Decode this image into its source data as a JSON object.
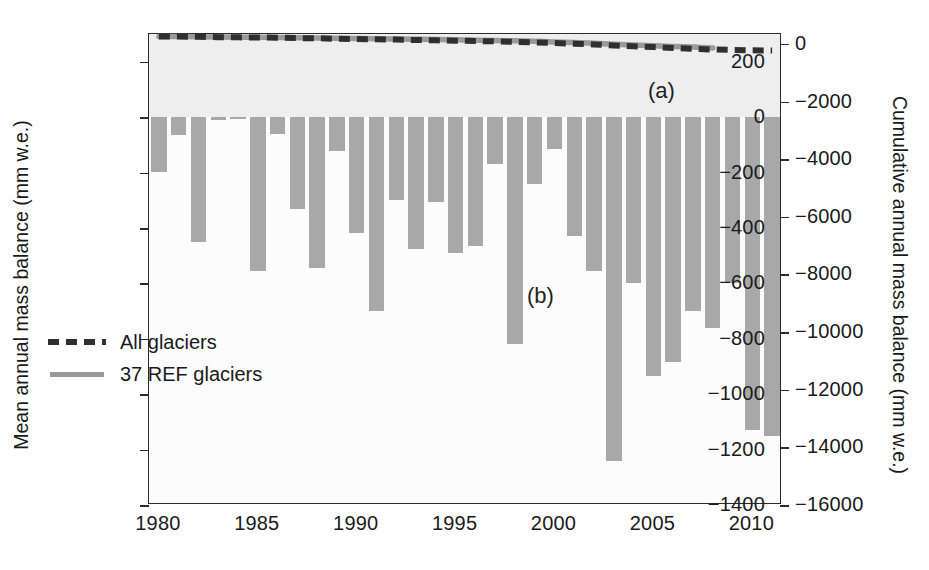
{
  "figure": {
    "panel_labels": [
      {
        "text": "(a)",
        "x_px": 648,
        "y_px": 78
      },
      {
        "text": "(b)",
        "x_px": 527,
        "y_px": 283
      }
    ]
  },
  "legend": {
    "position": "inside-lower-left",
    "entries": [
      {
        "label": "All glaciers",
        "style": "dashed",
        "color": "#2f2f2f"
      },
      {
        "label": "37 REF glaciers",
        "style": "solid",
        "color": "#9a9a9a"
      }
    ]
  },
  "chart_data": {
    "type": "bar",
    "title": "",
    "subtitle": "",
    "xlabel": "",
    "ylabel": "Mean annual mass balance (mm w.e.)",
    "y2label": "Cumulative annual mass balance (mm w.e.)",
    "grid": false,
    "xlim": [
      1979.5,
      2011.5
    ],
    "ylim": [
      -1400,
      300
    ],
    "y2lim": [
      -16000,
      343
    ],
    "xticks": [
      1980,
      1985,
      1990,
      1995,
      2000,
      2005,
      2010
    ],
    "xticklabels": [
      "1980",
      "1985",
      "1990",
      "1995",
      "2000",
      "2005",
      "2010"
    ],
    "yticks": [
      200,
      0,
      -200,
      -400,
      -600,
      -800,
      -1000,
      -1200,
      -1400
    ],
    "yticklabels": [
      "200",
      "0",
      "-200",
      "-400",
      "-600",
      "-800",
      "-1000",
      "-1200",
      "-1400"
    ],
    "y2ticks": [
      0,
      -2000,
      -4000,
      -6000,
      -8000,
      -10000,
      -12000,
      -14000,
      -16000
    ],
    "y2ticklabels": [
      "0",
      "-2000",
      "-4000",
      "-6000",
      "-8000",
      "-10000",
      "-12000",
      "-14000",
      "-16000"
    ],
    "bar_color": "#a8a8a8",
    "categories": [
      1980,
      1981,
      1982,
      1983,
      1984,
      1985,
      1986,
      1987,
      1988,
      1989,
      1990,
      1991,
      1992,
      1993,
      1994,
      1995,
      1996,
      1997,
      1998,
      1999,
      2000,
      2001,
      2002,
      2003,
      2004,
      2005,
      2006,
      2007,
      2008,
      2009,
      2010,
      2011
    ],
    "series": [
      {
        "name": "Mean annual mass balance",
        "axis": "left",
        "type": "bar",
        "values": [
          -198,
          -65,
          -450,
          -12,
          -8,
          -555,
          -60,
          -330,
          -545,
          -122,
          -420,
          -700,
          -300,
          -475,
          -308,
          -490,
          -465,
          -170,
          -820,
          -240,
          -115,
          -430,
          -555,
          -1240,
          -600,
          -935,
          -885,
          -700,
          -760,
          -600,
          -1130,
          -1150
        ]
      },
      {
        "name": "All glaciers",
        "axis": "right",
        "type": "line",
        "style": "dashed",
        "color": "#2f2f2f",
        "values": [
          258,
          255,
          248,
          232,
          226,
          222,
          215,
          200,
          196,
          178,
          168,
          160,
          148,
          136,
          123,
          112,
          100,
          88,
          72,
          52,
          28,
          8,
          -18,
          -58,
          -85,
          -112,
          -140,
          -168,
          -195,
          -210,
          -220,
          -232
        ]
      },
      {
        "name": "37 REF glaciers",
        "axis": "right",
        "type": "solid",
        "color": "#9a9a9a",
        "values": [
          258,
          256,
          250,
          236,
          231,
          228,
          222,
          212,
          208,
          196,
          186,
          180,
          172,
          160,
          150,
          140,
          130,
          120,
          108,
          90,
          66,
          44,
          20,
          -12,
          -40,
          -62,
          -88,
          -112,
          -140,
          null,
          null,
          null
        ]
      }
    ],
    "cumulative_line_left_axis_equiv": {
      "all_glaciers": [
        258,
        255,
        248,
        232,
        226,
        222,
        215,
        200,
        196,
        178,
        168,
        160,
        148,
        136,
        123,
        112,
        100,
        88,
        72,
        52,
        28,
        8,
        -18,
        -58,
        -85,
        -112,
        -140,
        -168,
        -195,
        -210,
        -220,
        -232
      ],
      "note": "lines plotted against right-hand cumulative axis"
    }
  }
}
